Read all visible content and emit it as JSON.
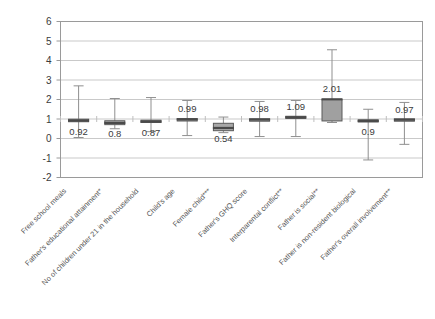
{
  "chart_data": {
    "type": "box",
    "title": "",
    "xlabel": "",
    "ylabel": "",
    "ylim": [
      -2,
      6
    ],
    "yticks": [
      -2,
      -1,
      0,
      1,
      2,
      3,
      4,
      5,
      6
    ],
    "ytick_labels": [
      "-2",
      "-1",
      "0",
      "1",
      "2",
      "3",
      "4",
      "5",
      "6"
    ],
    "grid": "horizontal",
    "legend": "none",
    "categories": [
      "Free school meals",
      "Father's educational attainment*",
      "No of children under 21 in the household",
      "Child's age",
      "Female child***",
      "Father's GHQ score",
      "Interparental conflict**",
      "Father is social**",
      "Father is non-resident biological",
      "Father's overall involvement**"
    ],
    "boxes": [
      {
        "category": "Free school meals",
        "label": "0.92",
        "value": 0.92,
        "whisker_low": 0.05,
        "q1": 0.86,
        "median": 0.92,
        "q3": 0.99,
        "whisker_high": 2.7,
        "fill": "#8c8c8c"
      },
      {
        "category": "Father's educational attainment*",
        "label": "0.8",
        "value": 0.8,
        "whisker_low": 0.5,
        "q1": 0.71,
        "median": 0.8,
        "q3": 0.91,
        "whisker_high": 2.05,
        "fill": "#b5b5b5"
      },
      {
        "category": "No of children under 21 in the household",
        "label": "0.87",
        "value": 0.87,
        "whisker_low": 0.35,
        "q1": 0.82,
        "median": 0.87,
        "q3": 0.94,
        "whisker_high": 2.1,
        "fill": "#8c8c8c"
      },
      {
        "category": "Child's age",
        "label": "0.99",
        "value": 0.99,
        "whisker_low": 0.15,
        "q1": 0.97,
        "median": 0.99,
        "q3": 1.01,
        "whisker_high": 1.95,
        "fill": "#8c8c8c"
      },
      {
        "category": "Female child***",
        "label": "0.54",
        "value": 0.54,
        "whisker_low": 0.3,
        "q1": 0.4,
        "median": 0.54,
        "q3": 0.78,
        "whisker_high": 1.1,
        "fill": "#a8a8a8"
      },
      {
        "category": "Father's GHQ score",
        "label": "0.98",
        "value": 0.98,
        "whisker_low": 0.1,
        "q1": 0.96,
        "median": 0.98,
        "q3": 1.0,
        "whisker_high": 1.9,
        "fill": "#8c8c8c"
      },
      {
        "category": "Interparental conflict**",
        "label": "1.09",
        "value": 1.09,
        "whisker_low": 0.1,
        "q1": 1.04,
        "median": 1.09,
        "q3": 1.14,
        "whisker_high": 1.95,
        "fill": "#8c8c8c"
      },
      {
        "category": "Father is social**",
        "label": "2.01",
        "value": 2.01,
        "whisker_low": 0.82,
        "q1": 0.9,
        "median": 2.01,
        "q3": 2.0,
        "whisker_high": 4.55,
        "fill": "#a0a0a0"
      },
      {
        "category": "Father is non-resident biological",
        "label": "0.9",
        "value": 0.9,
        "whisker_low": -1.1,
        "q1": 0.85,
        "median": 0.9,
        "q3": 0.96,
        "whisker_high": 1.5,
        "fill": "#8c8c8c"
      },
      {
        "category": "Father's overall involvement**",
        "label": "0.97",
        "value": 0.97,
        "whisker_low": -0.3,
        "q1": 0.94,
        "median": 0.97,
        "q3": 1.0,
        "whisker_high": 1.85,
        "fill": "#8c8c8c"
      }
    ],
    "colors": {
      "plot_border": "#9a9a9a",
      "gridline": "#c9c9c9",
      "box_stroke": "#5a5a5a",
      "whisker": "#8f8f8f",
      "text": "#3b3b3b",
      "background": "#ffffff"
    }
  }
}
